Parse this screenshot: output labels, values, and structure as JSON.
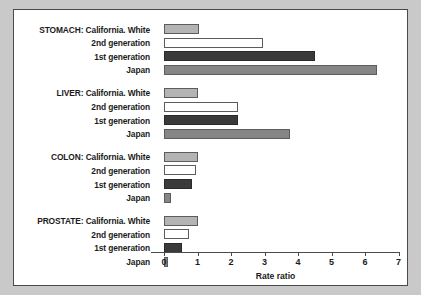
{
  "chart_data": {
    "type": "bar",
    "orientation": "horizontal",
    "title": "",
    "xlabel": "Rate ratio",
    "ylabel": "",
    "xlim": [
      0,
      7
    ],
    "xticks": [
      0,
      1,
      2,
      3,
      4,
      5,
      6,
      7
    ],
    "xtick_labels": [
      "0",
      "1",
      "2",
      "3",
      "4",
      "5",
      "6",
      "7"
    ],
    "grid": false,
    "legend": "none",
    "groups": [
      {
        "name": "STOMACH",
        "bars": [
          {
            "label": "STOMACH: California. White",
            "series": "California White",
            "value": 1.05,
            "color": "#b4b4b4"
          },
          {
            "label": "2nd generation",
            "series": "2nd generation",
            "value": 2.95,
            "color": "#ffffff"
          },
          {
            "label": "1st generation",
            "series": "1st generation",
            "value": 4.52,
            "color": "#3a3a3a"
          },
          {
            "label": "Japan",
            "series": "Japan",
            "value": 6.35,
            "color": "#868686"
          }
        ]
      },
      {
        "name": "LIVER",
        "bars": [
          {
            "label": "LIVER: California. White",
            "series": "California White",
            "value": 1.0,
            "color": "#b4b4b4"
          },
          {
            "label": "2nd generation",
            "series": "2nd generation",
            "value": 2.2,
            "color": "#ffffff"
          },
          {
            "label": "1st generation",
            "series": "1st generation",
            "value": 2.2,
            "color": "#3a3a3a"
          },
          {
            "label": "Japan",
            "series": "Japan",
            "value": 3.75,
            "color": "#868686"
          }
        ]
      },
      {
        "name": "COLON",
        "bars": [
          {
            "label": "COLON: California. White",
            "series": "California White",
            "value": 1.0,
            "color": "#b4b4b4"
          },
          {
            "label": "2nd generation",
            "series": "2nd generation",
            "value": 0.95,
            "color": "#ffffff"
          },
          {
            "label": "1st generation",
            "series": "1st generation",
            "value": 0.85,
            "color": "#3a3a3a"
          },
          {
            "label": "Japan",
            "series": "Japan",
            "value": 0.22,
            "color": "#868686"
          }
        ]
      },
      {
        "name": "PROSTATE",
        "bars": [
          {
            "label": "PROSTATE: California. White",
            "series": "California White",
            "value": 1.0,
            "color": "#b4b4b4"
          },
          {
            "label": "2nd generation",
            "series": "2nd generation",
            "value": 0.75,
            "color": "#ffffff"
          },
          {
            "label": "1st generation",
            "series": "1st generation",
            "value": 0.55,
            "color": "#3a3a3a"
          },
          {
            "label": "Japan",
            "series": "Japan",
            "value": 0.12,
            "color": "#868686"
          }
        ]
      }
    ]
  },
  "colors": {
    "page_background": "#c9c9c9",
    "panel_background": "#ffffff",
    "panel_border": "#4a4a4a",
    "axis": "#4a4a4a",
    "text": "#1b1b1b"
  }
}
